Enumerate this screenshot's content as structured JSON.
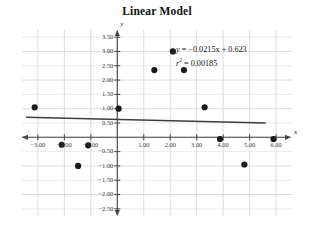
{
  "chart_data": {
    "type": "scatter",
    "title": "Linear Model",
    "xlabel": "x",
    "ylabel": "y",
    "grid": true,
    "legend": false,
    "xlim": [
      -3.6,
      6.6
    ],
    "ylim": [
      -2.75,
      3.75
    ],
    "xticks": [
      -3,
      -2,
      -1,
      1,
      2,
      3,
      4,
      5,
      6
    ],
    "xtick_labels": [
      "-3.00",
      "-2.00",
      "-1.00",
      "1.00",
      "2.00",
      "3.00",
      "4.00",
      "5.00",
      "6.00"
    ],
    "yticks": [
      3.5,
      3.0,
      2.5,
      2.0,
      1.5,
      1.0,
      0.5,
      -0.5,
      -1.0,
      -1.5,
      -2.0,
      -2.5
    ],
    "ytick_labels": [
      "3.50",
      "3.00",
      "2.50",
      "2.00",
      "1.50",
      "1.00",
      "0.50",
      "-0.50",
      "-1.00",
      "-1.50",
      "-2.00",
      "-2.50"
    ],
    "points": [
      {
        "x": -3.12,
        "y": 1.05
      },
      {
        "x": -2.1,
        "y": -0.26
      },
      {
        "x": -1.48,
        "y": -1.0
      },
      {
        "x": -1.1,
        "y": -0.28
      },
      {
        "x": 0.05,
        "y": 1.0
      },
      {
        "x": 1.4,
        "y": 2.35
      },
      {
        "x": 2.1,
        "y": 3.0
      },
      {
        "x": 2.52,
        "y": 2.35
      },
      {
        "x": 3.3,
        "y": 1.05
      },
      {
        "x": 3.88,
        "y": -0.06
      },
      {
        "x": 4.8,
        "y": -0.95
      },
      {
        "x": 5.9,
        "y": -0.06
      }
    ],
    "fit_line": {
      "slope": -0.0215,
      "intercept": 0.623,
      "x_start": -3.45,
      "x_end": 5.6
    },
    "r_squared": 0.00185,
    "annotations": {
      "equation_y": "y",
      "equation_body": " = −0.0215x + 0.623",
      "r2_symbol": "r",
      "r2_exponent": "2",
      "r2_body": " = 0.00185"
    },
    "colors": {
      "point": "#1a1a1a",
      "line": "#3c3c3c",
      "grid": "#d6d9de",
      "axis": "#444444",
      "text": "#111111"
    }
  }
}
